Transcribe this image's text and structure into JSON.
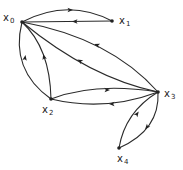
{
  "diagram": {
    "type": "directed-graph",
    "nodes": [
      {
        "id": "x0",
        "label": "x",
        "sub": "0",
        "x": 22,
        "y": 22,
        "lx": 3,
        "ly": 21
      },
      {
        "id": "x1",
        "label": "x",
        "sub": "1",
        "x": 112,
        "y": 21,
        "lx": 119,
        "ly": 24
      },
      {
        "id": "x2",
        "label": "x",
        "sub": "2",
        "x": 51,
        "y": 99,
        "lx": 42,
        "ly": 113
      },
      {
        "id": "x3",
        "label": "x",
        "sub": "3",
        "x": 158,
        "y": 92,
        "lx": 164,
        "ly": 97
      },
      {
        "id": "x4",
        "label": "x",
        "sub": "4",
        "x": 119,
        "y": 148,
        "lx": 117,
        "ly": 162
      }
    ],
    "edges": [
      {
        "from": "x0",
        "to": "x1",
        "d": "M22,22 Q68,-2 112,21",
        "ax": 70,
        "ay": 10,
        "rot": 0
      },
      {
        "from": "x1",
        "to": "x0",
        "d": "M112,21 L22,22",
        "ax": 75,
        "ay": 21.5,
        "rot": 180
      },
      {
        "from": "x3",
        "to": "x0",
        "d": "M158,92 Q110,38 22,22",
        "ax": 97,
        "ay": 45,
        "rot": 200
      },
      {
        "from": "x3",
        "to": "x0",
        "d": "M158,92 Q90,78 22,22",
        "ax": 80,
        "ay": 61,
        "rot": 210
      },
      {
        "from": "x2",
        "to": "x0",
        "d": "M51,99 Q50,48 22,22",
        "ax": 44,
        "ay": 57,
        "rot": 255
      },
      {
        "from": "x2",
        "to": "x0",
        "d": "M51,99 Q10,70 22,22",
        "ax": 25,
        "ay": 58,
        "rot": 280
      },
      {
        "from": "x2",
        "to": "x3",
        "d": "M51,99 Q95,82 158,92",
        "ax": 107,
        "ay": 90,
        "rot": 0
      },
      {
        "from": "x3",
        "to": "x2",
        "d": "M158,92 Q105,112 51,99",
        "ax": 112,
        "ay": 104,
        "rot": 180
      },
      {
        "from": "x4",
        "to": "x3",
        "d": "M119,148 Q125,112 158,92",
        "ax": 137,
        "ay": 114,
        "rot": 305
      },
      {
        "from": "x3",
        "to": "x4",
        "d": "M158,92 Q160,130 119,148",
        "ax": 147,
        "ay": 127,
        "rot": 130
      }
    ]
  }
}
